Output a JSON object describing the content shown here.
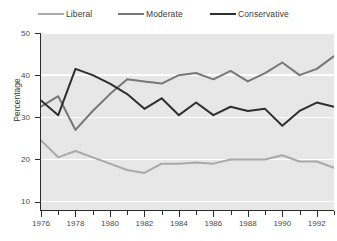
{
  "legend": {
    "items": [
      {
        "label": "Liberal",
        "color": "#a9a9a9"
      },
      {
        "label": "Moderate",
        "color": "#777777"
      },
      {
        "label": "Conservative",
        "color": "#2f2f2f"
      }
    ]
  },
  "axes": {
    "ylabel": "Percentage",
    "yticks": [
      "10",
      "20",
      "30",
      "40",
      "50"
    ],
    "xticklabels": [
      "1976",
      "1978",
      "1980",
      "1982",
      "1984",
      "1986",
      "1988",
      "1990",
      "1992"
    ]
  },
  "chart_data": {
    "type": "line",
    "title": "",
    "xlabel": "",
    "ylabel": "Percentage",
    "ylim": [
      8,
      50
    ],
    "xlim": [
      1976,
      1993
    ],
    "grid": true,
    "legend_position": "top",
    "x": [
      1976,
      1977,
      1978,
      1979,
      1980,
      1981,
      1982,
      1983,
      1984,
      1985,
      1986,
      1987,
      1988,
      1989,
      1990,
      1991,
      1992,
      1993
    ],
    "series": [
      {
        "name": "Liberal",
        "color": "#a9a9a9",
        "values": [
          24.5,
          20.5,
          22.0,
          20.5,
          19.0,
          17.5,
          16.8,
          19.0,
          19.0,
          19.3,
          19.0,
          20.0,
          20.0,
          20.0,
          21.0,
          19.5,
          19.5,
          18.0
        ]
      },
      {
        "name": "Moderate",
        "color": "#777777",
        "values": [
          32.5,
          35.0,
          27.0,
          31.5,
          35.5,
          39.0,
          38.5,
          38.0,
          40.0,
          40.5,
          39.0,
          41.0,
          38.5,
          40.5,
          43.0,
          40.0,
          41.5,
          44.5
        ]
      },
      {
        "name": "Conservative",
        "color": "#2f2f2f",
        "values": [
          34.0,
          30.5,
          41.5,
          40.0,
          38.0,
          35.5,
          32.0,
          34.5,
          30.5,
          33.5,
          30.5,
          32.5,
          31.5,
          32.0,
          28.0,
          31.5,
          33.5,
          32.5
        ]
      }
    ]
  }
}
